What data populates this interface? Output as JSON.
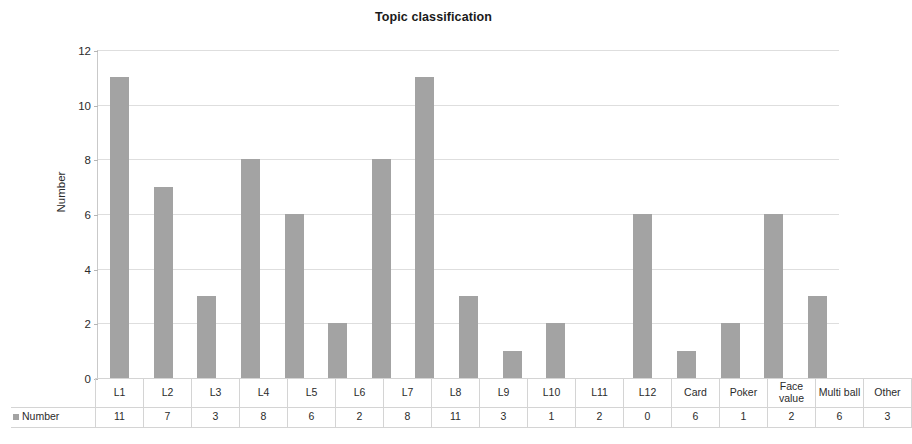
{
  "chart_data": {
    "type": "bar",
    "title": "Topic classification",
    "xlabel": "",
    "ylabel": "Number",
    "ylim": [
      0,
      12
    ],
    "yticks": [
      0,
      2,
      4,
      6,
      8,
      10,
      12
    ],
    "grid": true,
    "legend_position": "table-row",
    "series_name": "Number",
    "bar_color": "#a3a3a3",
    "categories": [
      "L1",
      "L2",
      "L3",
      "L4",
      "L5",
      "L6",
      "L7",
      "L8",
      "L9",
      "L10",
      "L11",
      "L12",
      "Card",
      "Poker",
      "Face value",
      "Multi ball",
      "Other"
    ],
    "values": [
      11,
      7,
      3,
      8,
      6,
      2,
      8,
      11,
      3,
      1,
      2,
      0,
      6,
      1,
      2,
      6,
      3
    ]
  },
  "table": {
    "row_label": "Number",
    "header_cells": [
      "L1",
      "L2",
      "L3",
      "L4",
      "L5",
      "L6",
      "L7",
      "L8",
      "L9",
      "L10",
      "L11",
      "L12",
      "Card",
      "Poker",
      "Face value",
      "Multi ball",
      "Other"
    ],
    "value_cells": [
      "11",
      "7",
      "3",
      "8",
      "6",
      "2",
      "8",
      "11",
      "3",
      "1",
      "2",
      "0",
      "6",
      "1",
      "2",
      "6",
      "3"
    ]
  }
}
